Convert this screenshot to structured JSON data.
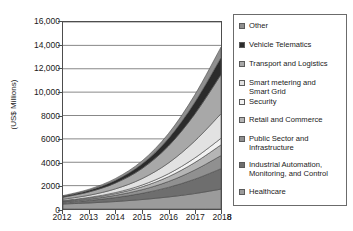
{
  "page_number": "8",
  "chart_data": {
    "type": "area",
    "stacked": true,
    "title": "",
    "xlabel": "",
    "ylabel": "(US$ Millions)",
    "x": [
      2012,
      2013,
      2014,
      2015,
      2016,
      2017,
      2018
    ],
    "xtick_labels": [
      "2012",
      "2013",
      "2014",
      "2015",
      "2016",
      "2017",
      "2018"
    ],
    "ylim": [
      0,
      16000
    ],
    "ytick_values": [
      0,
      2000,
      4000,
      6000,
      8000,
      10000,
      12000,
      14000,
      16000
    ],
    "ytick_labels": [
      "0",
      "2000",
      "4000",
      "6000",
      "8000",
      "10,000",
      "12,000",
      "14,000",
      "16,000"
    ],
    "grid": true,
    "grid_axis": "y",
    "legend_position": "right",
    "stack_order_bottom_to_top": [
      "Healthcare",
      "Industrial Automation, Monitoring, and Control",
      "Public Sector and Infrastructure",
      "Retail and Commerce",
      "Security",
      "Smart metering and Smart Grid",
      "Transport and Logistics",
      "Vehicle Telematics",
      "Other"
    ],
    "series": [
      {
        "name": "Other",
        "label": "Other",
        "color": "#8f8f8f",
        "values": [
          60,
          95,
          160,
          260,
          420,
          640,
          900
        ]
      },
      {
        "name": "Vehicle Telematics",
        "label": "Vehicle Telematics",
        "color": "#2b2b2b",
        "values": [
          80,
          135,
          230,
          390,
          640,
          1000,
          1450
        ]
      },
      {
        "name": "Transport and Logistics",
        "label": "Transport and Logistics",
        "color": "#a8a8a8",
        "values": [
          170,
          290,
          500,
          860,
          1450,
          2300,
          3350
        ]
      },
      {
        "name": "Smart metering and Smart Grid",
        "label": "Smart metering and\nSmart Grid",
        "color": "#e2e2e2",
        "values": [
          110,
          185,
          320,
          550,
          920,
          1450,
          2100
        ]
      },
      {
        "name": "Security",
        "label": "Security",
        "color": "#f2f2f2",
        "values": [
          35,
          55,
          90,
          150,
          250,
          390,
          560
        ]
      },
      {
        "name": "Retail and Commerce",
        "label": "Retail and Commerce",
        "color": "#b5b5b5",
        "values": [
          55,
          90,
          150,
          250,
          410,
          640,
          920
        ]
      },
      {
        "name": "Public Sector and Infrastructure",
        "label": "Public Sector and\nInfrastructure",
        "color": "#909090",
        "values": [
          70,
          115,
          190,
          310,
          500,
          780,
          1120
        ]
      },
      {
        "name": "Industrial Automation, Monitoring, and Control",
        "label": "Industrial Automation,\nMonitoring, and Control",
        "color": "#6e6e6e",
        "values": [
          135,
          215,
          340,
          530,
          820,
          1230,
          1750
        ]
      },
      {
        "name": "Healthcare",
        "label": "Healthcare",
        "color": "#9b9b9b",
        "values": [
          430,
          520,
          640,
          810,
          1030,
          1320,
          1700
        ]
      }
    ]
  }
}
